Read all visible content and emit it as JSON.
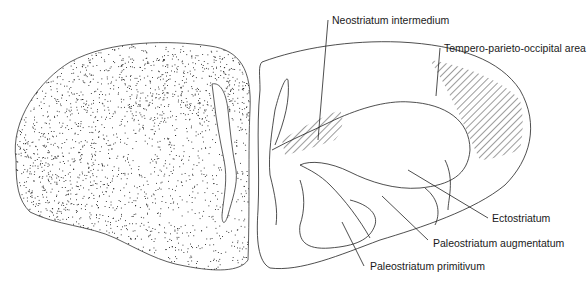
{
  "diagram": {
    "labels": {
      "neostriatum_intermedium": "Neostriatum intermedium",
      "tempero_parieto_occipital": "Tempero-parieto-occipital area",
      "ectostriatum": "Ectostriatum",
      "paleostriatum_augmentatum": "Paleostriatum augmentatum",
      "paleostriatum_primitivum": "Paleostriatum primitivum"
    },
    "colors": {
      "line": "#222222",
      "background": "#ffffff",
      "stipple": "#1a1a1a"
    }
  }
}
